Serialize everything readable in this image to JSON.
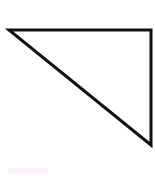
{
  "diagram": {
    "shape": "right-triangle",
    "stroke_color": "#111111",
    "fill_color": "#ffffff",
    "stroke_width": 3,
    "vertices": [
      {
        "x": 9,
        "y": 30
      },
      {
        "x": 151,
        "y": 30
      },
      {
        "x": 151,
        "y": 145
      }
    ]
  }
}
